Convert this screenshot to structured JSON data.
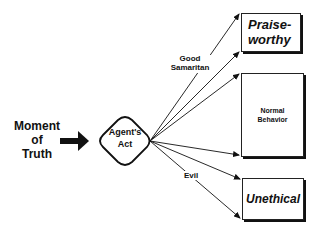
{
  "diagram": {
    "start_label": "Moment of Truth",
    "start_lines": [
      "Moment",
      "of",
      "Truth"
    ],
    "decision_node": {
      "label": "Agent's Act",
      "lines": [
        "Agent's",
        "Act"
      ],
      "shape": "rounded-diamond"
    },
    "branch_labels": {
      "good": [
        "Good",
        "Samaritan"
      ],
      "evil": "Evil"
    },
    "outcomes": [
      {
        "id": "praiseworthy",
        "lines": [
          "Praise-",
          "worthy"
        ],
        "style": "bold-italic"
      },
      {
        "id": "normal",
        "lines": [
          "Normal",
          "Behavior"
        ],
        "style": "bold"
      },
      {
        "id": "unethical",
        "lines": [
          "Unethical"
        ],
        "style": "bold-italic"
      }
    ],
    "edges": [
      {
        "from": "Moment of Truth",
        "to": "Agent's Act",
        "style": "thick-arrow"
      },
      {
        "from": "Agent's Act",
        "to": "Praiseworthy (top)",
        "label": "Good Samaritan"
      },
      {
        "from": "Agent's Act",
        "to": "Praiseworthy (bottom)"
      },
      {
        "from": "Agent's Act",
        "to": "Normal Behavior (top)"
      },
      {
        "from": "Agent's Act",
        "to": "Normal Behavior (bottom)"
      },
      {
        "from": "Agent's Act",
        "to": "Unethical (top)"
      },
      {
        "from": "Agent's Act",
        "to": "Unethical (bottom)",
        "label": "Evil"
      }
    ],
    "colors": {
      "line": "#111111",
      "background": "#ffffff"
    }
  }
}
